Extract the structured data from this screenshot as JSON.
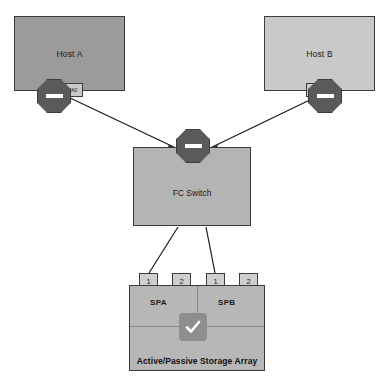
{
  "diagram": {
    "hosts": [
      {
        "id": "host-a",
        "label": "Host A",
        "hba_label": "HA0"
      },
      {
        "id": "host-b",
        "label": "Host B",
        "hba_label": "HB"
      }
    ],
    "switch": {
      "label": "FC Switch"
    },
    "storage": {
      "caption": "Active/Passive Storage Array",
      "processors": [
        {
          "name": "SPA",
          "ports": [
            "1",
            "2"
          ]
        },
        {
          "name": "SPB",
          "ports": [
            "1",
            "2"
          ]
        }
      ],
      "status_icon": "checkmark-icon"
    },
    "icons": {
      "blocked": "blocked-link-icon"
    },
    "colors": {
      "host_a_fill": "#9b9b9b",
      "host_b_fill": "#c9c9c9",
      "switch_fill": "#b4b4b4",
      "array_fill": "#b7b7b7",
      "port_fill": "#cfcfcf",
      "octagon_fill": "#5a5a5a",
      "check_tile_fill": "#8e8e8e",
      "outline": "#3b3b3b"
    }
  }
}
